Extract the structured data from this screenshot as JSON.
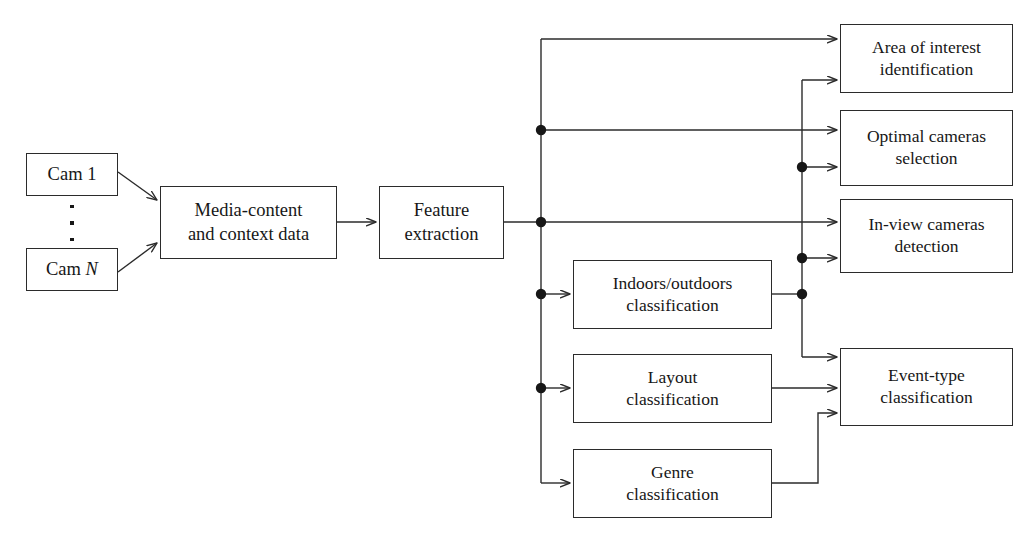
{
  "diagram": {
    "type": "flowchart",
    "stroke_color": "#2b2b2b",
    "text_color": "#171717",
    "background": "#ffffff",
    "nodes": [
      {
        "id": "cam1",
        "label": "Cam 1",
        "x": 26,
        "y": 153,
        "w": 92,
        "h": 43
      },
      {
        "id": "camN",
        "label": "Cam N",
        "x": 26,
        "y": 248,
        "w": 92,
        "h": 43
      },
      {
        "id": "media",
        "label": "Media-content\nand context data",
        "x": 160,
        "y": 186,
        "w": 177,
        "h": 73
      },
      {
        "id": "feature",
        "label": "Feature\nextraction",
        "x": 379,
        "y": 186,
        "w": 125,
        "h": 73
      },
      {
        "id": "indoors",
        "label": "Indoors/outdoors\nclassification",
        "x": 573,
        "y": 260,
        "w": 199,
        "h": 69
      },
      {
        "id": "layout",
        "label": "Layout\nclassification",
        "x": 573,
        "y": 354,
        "w": 199,
        "h": 69
      },
      {
        "id": "genre",
        "label": "Genre\nclassification",
        "x": 573,
        "y": 449,
        "w": 199,
        "h": 69
      },
      {
        "id": "areaint",
        "label": "Area of interest\nidentification",
        "x": 840,
        "y": 24,
        "w": 173,
        "h": 69
      },
      {
        "id": "optimal",
        "label": "Optimal cameras\nselection",
        "x": 840,
        "y": 110,
        "w": 173,
        "h": 76
      },
      {
        "id": "inview",
        "label": "In-view cameras\ndetection",
        "x": 840,
        "y": 199,
        "w": 173,
        "h": 74
      },
      {
        "id": "eventtype",
        "label": "Event-type\nclassification",
        "x": 840,
        "y": 348,
        "w": 173,
        "h": 78
      }
    ],
    "ellipsis": {
      "label": "vertical-ellipsis",
      "x": 69,
      "y": 205,
      "count": 3
    },
    "edges": [
      {
        "from": "cam1",
        "to": "media",
        "kind": "diagonal-arrow"
      },
      {
        "from": "camN",
        "to": "media",
        "kind": "diagonal-arrow"
      },
      {
        "from": "media",
        "to": "feature",
        "kind": "straight-arrow"
      },
      {
        "from": "feature",
        "to": "bus-left",
        "kind": "line-with-junction"
      },
      {
        "from": "bus-left",
        "to": "areaint",
        "kind": "orthogonal-arrow"
      },
      {
        "from": "bus-left",
        "to": "optimal",
        "kind": "orthogonal-arrow"
      },
      {
        "from": "bus-left",
        "to": "inview",
        "kind": "orthogonal-arrow"
      },
      {
        "from": "bus-left",
        "to": "indoors",
        "kind": "orthogonal-arrow"
      },
      {
        "from": "bus-left",
        "to": "layout",
        "kind": "orthogonal-arrow"
      },
      {
        "from": "bus-left",
        "to": "genre",
        "kind": "orthogonal-arrow"
      },
      {
        "from": "indoors",
        "to": "bus-right",
        "kind": "line-with-junction"
      },
      {
        "from": "bus-right",
        "to": "areaint",
        "kind": "orthogonal-arrow"
      },
      {
        "from": "bus-right",
        "to": "optimal",
        "kind": "orthogonal-arrow"
      },
      {
        "from": "bus-right",
        "to": "inview",
        "kind": "orthogonal-arrow"
      },
      {
        "from": "bus-right",
        "to": "eventtype",
        "kind": "orthogonal-arrow"
      },
      {
        "from": "layout",
        "to": "eventtype",
        "kind": "straight-arrow"
      },
      {
        "from": "genre",
        "to": "eventtype",
        "kind": "orthogonal-arrow"
      }
    ],
    "junction_dots": [
      {
        "id": "dot-left-1",
        "x": 541,
        "y": 130
      },
      {
        "id": "dot-left-2",
        "x": 541,
        "y": 222
      },
      {
        "id": "dot-left-3",
        "x": 541,
        "y": 294
      },
      {
        "id": "dot-left-4",
        "x": 541,
        "y": 388
      },
      {
        "id": "dot-right-1",
        "x": 802,
        "y": 167
      },
      {
        "id": "dot-right-2",
        "x": 802,
        "y": 258
      },
      {
        "id": "dot-right-3",
        "x": 802,
        "y": 294
      }
    ]
  }
}
